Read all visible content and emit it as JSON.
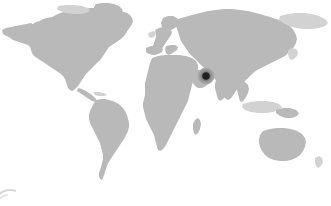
{
  "widget": {
    "name": "world-map-location",
    "width": 331,
    "height": 206,
    "background_color": "#ffffff",
    "land_color": "#b9b9b9",
    "land_faint_color": "#d2d2d2",
    "alt_text": "World map with a single location marker"
  },
  "marker": {
    "label": "",
    "region": "Persian Gulf / Arabian Peninsula",
    "x_px": 206,
    "y_px": 76,
    "diameter_px": 17,
    "core_diameter_px": 7,
    "core_color": "#202020",
    "ring_color": "#8e8e8e",
    "halo_color": "#b4b4b4"
  },
  "watermark": {
    "visible": true,
    "position": "bottom-left",
    "color": "#d8d8d8"
  },
  "chart_data": {
    "type": "map",
    "title": "",
    "projection": "equirectangular",
    "basemap": "world-continents",
    "legend": [],
    "points": [
      {
        "name": "",
        "region": "Persian Gulf / Arabian Peninsula",
        "x_px": 206,
        "y_px": 76,
        "marker": "circle",
        "size_px": 17,
        "color": "#202020"
      }
    ]
  }
}
